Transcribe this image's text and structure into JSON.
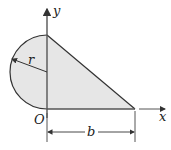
{
  "diagram": {
    "type": "composite-area-figure",
    "labels": {
      "y_axis": "y",
      "x_axis": "x",
      "origin": "O",
      "radius": "r",
      "base": "b"
    },
    "colors": {
      "fill": "#e6e6e6",
      "stroke": "#333333",
      "axis": "#444444"
    },
    "shapes": [
      {
        "name": "semicircle",
        "center": [
          47,
          72
        ],
        "radius": 37,
        "side": "left"
      },
      {
        "name": "triangle",
        "vertices": [
          [
            47,
            35
          ],
          [
            47,
            109
          ],
          [
            135,
            109
          ]
        ]
      }
    ]
  }
}
